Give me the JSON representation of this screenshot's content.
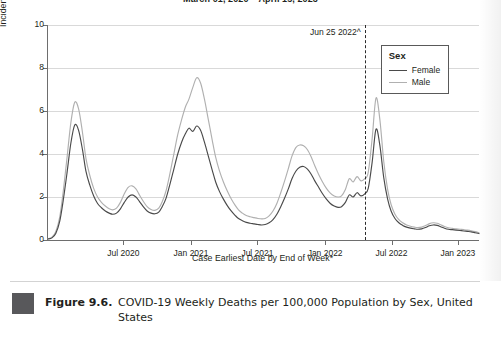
{
  "figure": {
    "number": "Figure 9.6.",
    "caption": "COVID-19 Weekly Deaths per 100,000 Population by Sex, United States"
  },
  "chart_data": {
    "type": "line",
    "title": "March 01, 2020 – April 15, 2023",
    "xlabel": "Case Earliest Date by End of Week*",
    "ylabel": "Incident Deaths per 100,000 Population",
    "ylim": [
      0,
      10
    ],
    "yticks": [
      0,
      2,
      4,
      6,
      8,
      10
    ],
    "ytick_labels": [
      "0",
      "2",
      "4",
      "6",
      "8",
      "10"
    ],
    "xtick_labels": [
      "Jul 2020",
      "Jan 2021",
      "Jul 2021",
      "Jan 2022",
      "Jul 2022",
      "Jan 2023"
    ],
    "xtick_positions": [
      0.175,
      0.332,
      0.486,
      0.643,
      0.797,
      0.951
    ],
    "grid": "horizontal",
    "legend": {
      "title": "Sex",
      "position": "top-right",
      "entries": [
        {
          "name": "Female",
          "color": "#4a4a4a"
        },
        {
          "name": "Male",
          "color": "#b0b0b0"
        }
      ]
    },
    "annotations": [
      {
        "label": "Jun 25 2022^",
        "x": 0.735,
        "type": "vertical-dashed-line"
      }
    ],
    "x": [
      0.0,
      0.009,
      0.018,
      0.027,
      0.035,
      0.044,
      0.053,
      0.062,
      0.071,
      0.08,
      0.088,
      0.097,
      0.106,
      0.115,
      0.124,
      0.133,
      0.142,
      0.15,
      0.159,
      0.168,
      0.177,
      0.186,
      0.195,
      0.204,
      0.212,
      0.221,
      0.23,
      0.239,
      0.248,
      0.257,
      0.265,
      0.274,
      0.283,
      0.292,
      0.301,
      0.31,
      0.319,
      0.327,
      0.336,
      0.345,
      0.354,
      0.363,
      0.372,
      0.381,
      0.389,
      0.398,
      0.407,
      0.416,
      0.425,
      0.434,
      0.442,
      0.451,
      0.46,
      0.469,
      0.478,
      0.487,
      0.496,
      0.504,
      0.513,
      0.522,
      0.531,
      0.54,
      0.549,
      0.558,
      0.566,
      0.575,
      0.584,
      0.593,
      0.602,
      0.611,
      0.619,
      0.628,
      0.637,
      0.646,
      0.655,
      0.664,
      0.673,
      0.681,
      0.69,
      0.699,
      0.708,
      0.717,
      0.726,
      0.735,
      0.743,
      0.752,
      0.761,
      0.77,
      0.779,
      0.788,
      0.796,
      0.805,
      0.814,
      0.823,
      0.832,
      0.841,
      0.85,
      0.858,
      0.867,
      0.876,
      0.885,
      0.894,
      0.903,
      0.911,
      0.92,
      0.929,
      0.938,
      0.947,
      0.956,
      0.965,
      0.973,
      0.982,
      0.991,
      1.0
    ],
    "series": [
      {
        "name": "Female",
        "color": "#4a4a4a",
        "values": [
          0.05,
          0.1,
          0.3,
          0.85,
          1.8,
          3.1,
          4.5,
          5.35,
          5.1,
          4.2,
          3.2,
          2.55,
          2.05,
          1.7,
          1.5,
          1.35,
          1.25,
          1.2,
          1.25,
          1.45,
          1.75,
          2.0,
          2.1,
          2.0,
          1.8,
          1.55,
          1.35,
          1.25,
          1.22,
          1.3,
          1.55,
          1.95,
          2.6,
          3.3,
          4.0,
          4.55,
          4.95,
          5.2,
          5.05,
          5.3,
          5.1,
          4.55,
          3.9,
          3.25,
          2.7,
          2.25,
          1.9,
          1.6,
          1.35,
          1.15,
          1.0,
          0.9,
          0.82,
          0.78,
          0.75,
          0.72,
          0.7,
          0.72,
          0.8,
          0.95,
          1.2,
          1.55,
          1.95,
          2.4,
          2.85,
          3.2,
          3.38,
          3.42,
          3.3,
          3.05,
          2.75,
          2.45,
          2.15,
          1.9,
          1.7,
          1.58,
          1.52,
          1.55,
          1.75,
          2.1,
          2.0,
          2.2,
          2.05,
          2.15,
          2.4,
          3.6,
          5.15,
          4.4,
          2.9,
          1.9,
          1.35,
          1.0,
          0.8,
          0.68,
          0.6,
          0.55,
          0.52,
          0.5,
          0.52,
          0.58,
          0.66,
          0.7,
          0.68,
          0.62,
          0.55,
          0.5,
          0.48,
          0.46,
          0.44,
          0.42,
          0.4,
          0.38,
          0.34,
          0.3
        ]
      },
      {
        "name": "Male",
        "color": "#b0b0b0",
        "values": [
          0.06,
          0.13,
          0.38,
          1.05,
          2.2,
          3.8,
          5.45,
          6.4,
          6.1,
          5.0,
          3.8,
          3.0,
          2.4,
          2.0,
          1.75,
          1.58,
          1.45,
          1.4,
          1.48,
          1.75,
          2.15,
          2.45,
          2.52,
          2.38,
          2.1,
          1.8,
          1.55,
          1.42,
          1.38,
          1.48,
          1.78,
          2.3,
          3.1,
          4.0,
          4.9,
          5.6,
          6.2,
          6.55,
          7.1,
          7.55,
          7.3,
          6.55,
          5.6,
          4.65,
          3.85,
          3.2,
          2.7,
          2.28,
          1.92,
          1.62,
          1.4,
          1.25,
          1.14,
          1.08,
          1.04,
          1.0,
          0.98,
          1.0,
          1.12,
          1.35,
          1.7,
          2.2,
          2.75,
          3.35,
          3.9,
          4.3,
          4.42,
          4.38,
          4.2,
          3.85,
          3.45,
          3.05,
          2.7,
          2.4,
          2.18,
          2.05,
          2.0,
          2.05,
          2.35,
          2.85,
          2.7,
          2.95,
          2.75,
          2.85,
          3.15,
          4.7,
          6.6,
          5.6,
          3.65,
          2.35,
          1.65,
          1.2,
          0.95,
          0.8,
          0.7,
          0.64,
          0.6,
          0.58,
          0.6,
          0.67,
          0.76,
          0.8,
          0.78,
          0.71,
          0.63,
          0.57,
          0.54,
          0.52,
          0.5,
          0.48,
          0.46,
          0.43,
          0.39,
          0.34
        ]
      }
    ]
  }
}
